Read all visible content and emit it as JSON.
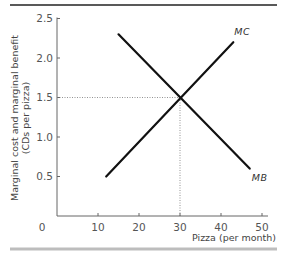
{
  "chart_data": {
    "type": "line",
    "title": "",
    "xlabel": "Pizza (per month)",
    "ylabel": "Marginal cost and marginal benefit (CDs per pizza)",
    "ylabel_line1": "Marginal cost and marginal benefit",
    "ylabel_line2": "(CDs per pizza)",
    "xlim": [
      0,
      50
    ],
    "ylim": [
      0,
      2.5
    ],
    "x_ticks": [
      0,
      10,
      20,
      30,
      40,
      50
    ],
    "x_tick_labels": [
      "0",
      "10",
      "20",
      "30",
      "40",
      "50"
    ],
    "y_ticks": [
      0.5,
      1.0,
      1.5,
      2.0,
      2.5
    ],
    "y_tick_labels": [
      "0.5",
      "1.0",
      "1.5",
      "2.0",
      "2.5"
    ],
    "grid": false,
    "series": [
      {
        "name": "MC",
        "label": "MC",
        "x": [
          12,
          43
        ],
        "y": [
          0.5,
          2.2
        ]
      },
      {
        "name": "MB",
        "label": "MB",
        "x": [
          15,
          47
        ],
        "y": [
          2.3,
          0.6
        ]
      }
    ],
    "annotations": [
      {
        "type": "equilibrium",
        "x": 30,
        "y": 1.5,
        "style": "dotted guide lines to both axes"
      }
    ]
  }
}
